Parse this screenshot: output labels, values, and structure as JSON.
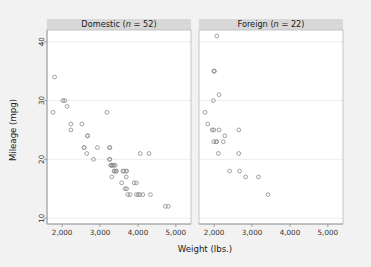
{
  "chart_data": {
    "type": "scatter",
    "title": "",
    "xlabel": "Weight (lbs.)",
    "ylabel": "Mileage (mpg)",
    "xlim": [
      1600,
      5400
    ],
    "ylim": [
      9,
      42
    ],
    "xticks": [
      2000,
      3000,
      4000,
      5000
    ],
    "xticklabels": [
      "2,000",
      "3,000",
      "4,000",
      "5,000"
    ],
    "yticks": [
      10,
      20,
      30,
      40
    ],
    "yticklabels": [
      "10",
      "20",
      "30",
      "40"
    ],
    "grid": "horizontal",
    "legend": "none",
    "marker": "open-circle",
    "marker_color": "#8a8a8a",
    "panel_header_color": "#d8d8d8",
    "background_color": "#f2f2f2",
    "plot_background_color": "#ffffff",
    "panels": [
      {
        "name": "domestic",
        "label_prefix": "Domestic (",
        "label_italic": "n",
        "label_suffix": " = 52)",
        "label": "Domestic (n = 52)",
        "n": 52,
        "points": [
          [
            1800,
            34
          ],
          [
            1760,
            28
          ],
          [
            2020,
            30
          ],
          [
            2070,
            30
          ],
          [
            2130,
            29
          ],
          [
            2230,
            26
          ],
          [
            2230,
            25
          ],
          [
            2520,
            26
          ],
          [
            2580,
            22
          ],
          [
            2580,
            22
          ],
          [
            2650,
            21
          ],
          [
            2670,
            24
          ],
          [
            2670,
            24
          ],
          [
            2830,
            20
          ],
          [
            2930,
            22
          ],
          [
            3180,
            28
          ],
          [
            3250,
            22
          ],
          [
            3260,
            22
          ],
          [
            3250,
            20
          ],
          [
            3260,
            20
          ],
          [
            3280,
            19
          ],
          [
            3300,
            19
          ],
          [
            3310,
            19
          ],
          [
            3350,
            19
          ],
          [
            3360,
            19
          ],
          [
            3400,
            19
          ],
          [
            3370,
            18
          ],
          [
            3380,
            18
          ],
          [
            3420,
            18
          ],
          [
            3430,
            18
          ],
          [
            3310,
            17
          ],
          [
            3600,
            18
          ],
          [
            3630,
            18
          ],
          [
            3690,
            18
          ],
          [
            3700,
            18
          ],
          [
            3690,
            17
          ],
          [
            3660,
            15
          ],
          [
            3700,
            15
          ],
          [
            3730,
            14
          ],
          [
            3790,
            14
          ],
          [
            3900,
            16
          ],
          [
            3960,
            16
          ],
          [
            4060,
            21
          ],
          [
            3960,
            14
          ],
          [
            4010,
            14
          ],
          [
            4050,
            14
          ],
          [
            4130,
            14
          ],
          [
            4290,
            21
          ],
          [
            4330,
            14
          ],
          [
            4720,
            12
          ],
          [
            4800,
            12
          ],
          [
            3570,
            16
          ]
        ]
      },
      {
        "name": "foreign",
        "label_prefix": "Foreign (",
        "label_italic": "n",
        "label_suffix": " = 22)",
        "label": "Foreign (n = 22)",
        "n": 22,
        "points": [
          [
            2070,
            41
          ],
          [
            1990,
            35
          ],
          [
            2010,
            35
          ],
          [
            2130,
            31
          ],
          [
            1980,
            30
          ],
          [
            1760,
            28
          ],
          [
            1830,
            26
          ],
          [
            1950,
            25
          ],
          [
            1990,
            25
          ],
          [
            2130,
            25
          ],
          [
            2650,
            25
          ],
          [
            2280,
            24
          ],
          [
            1990,
            23
          ],
          [
            2050,
            23
          ],
          [
            2070,
            23
          ],
          [
            2240,
            23
          ],
          [
            2110,
            21
          ],
          [
            2650,
            21
          ],
          [
            2410,
            18
          ],
          [
            2670,
            18
          ],
          [
            2830,
            17
          ],
          [
            3170,
            17
          ],
          [
            3420,
            14
          ]
        ]
      }
    ]
  }
}
